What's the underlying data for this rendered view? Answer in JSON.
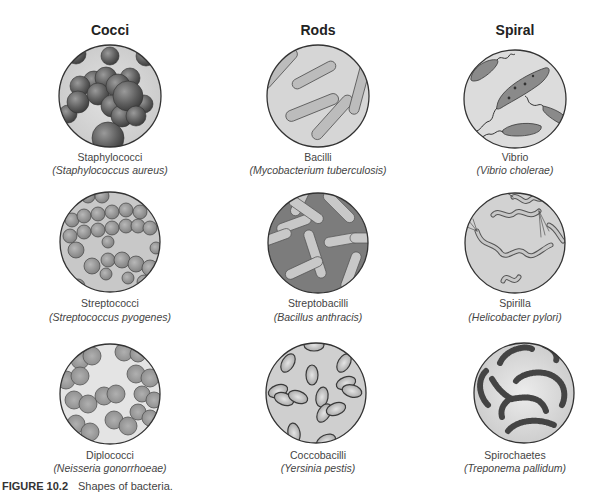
{
  "columns": [
    {
      "header": "Cocci"
    },
    {
      "header": "Rods"
    },
    {
      "header": "Spiral"
    }
  ],
  "cells": {
    "staphylococci": {
      "common": "Staphylococci",
      "scientific": "(Staphylococcus aureus)"
    },
    "bacilli": {
      "common": "Bacilli",
      "scientific": "(Mycobacterium tuberculosis)"
    },
    "vibrio": {
      "common": "Vibrio",
      "scientific": "(Vibrio cholerae)"
    },
    "streptococci": {
      "common": "Streptococci",
      "scientific": "(Streptococcus pyogenes)"
    },
    "streptobacilli": {
      "common": "Streptobacilli",
      "scientific": "(Bacillus anthracis)"
    },
    "spirilla": {
      "common": "Spirilla",
      "scientific": "(Helicobacter pylori)"
    },
    "diplococci": {
      "common": "Diplococci",
      "scientific": "(Neisseria gonorrhoeae)"
    },
    "coccobacilli": {
      "common": "Coccobacilli",
      "scientific": "(Yersinia pestis)"
    },
    "spirochaetes": {
      "common": "Spirochaetes",
      "scientific": "(Treponema pallidum)"
    }
  },
  "caption": {
    "label": "FIGURE 10.2",
    "text": "Shapes of bacteria."
  },
  "colors": {
    "circle_bg": "#d4d4d4",
    "circle_border": "#333333",
    "cell_dark": "#6a6a6a",
    "cell_mid": "#9a9a9a",
    "cell_light": "#c4c4c4"
  }
}
